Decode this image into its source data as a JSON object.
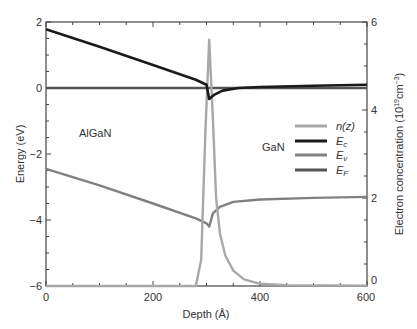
{
  "chart_data": {
    "type": "line",
    "title": "",
    "xlabel": "Depth (Å)",
    "ylabel_left": "Energy (eV)",
    "ylabel_right": "Electron concentration (10^19 cm^-3)",
    "xlim": [
      0,
      600
    ],
    "ylim_left": [
      -6,
      2
    ],
    "ylim_right": [
      0,
      6
    ],
    "x_ticks": [
      0,
      200,
      400,
      600
    ],
    "y_left_ticks": [
      -6,
      -4,
      -2,
      0,
      2
    ],
    "y_right_ticks": [
      0,
      2,
      4,
      6
    ],
    "annotations": [
      {
        "text": "AlGaN",
        "x": 90,
        "y": -1.3
      },
      {
        "text": "GaN",
        "x": 395,
        "y": -1.7
      }
    ],
    "legend": {
      "position": "center-right",
      "entries": [
        "n(z)",
        "Ec",
        "Ev",
        "EF"
      ]
    },
    "series": [
      {
        "name": "n(z)",
        "axis": "right",
        "color": "#a8a8a8",
        "x": [
          0,
          280,
          290,
          298,
          305,
          312,
          318,
          325,
          335,
          350,
          370,
          400,
          450,
          600
        ],
        "y": [
          0,
          0,
          0.6,
          3.5,
          5.6,
          3.8,
          2.0,
          1.2,
          0.7,
          0.35,
          0.15,
          0.05,
          0.02,
          0.01
        ]
      },
      {
        "name": "Ec",
        "axis": "left",
        "color": "#1a1a1a",
        "x": [
          0,
          100,
          200,
          280,
          300,
          305,
          315,
          330,
          360,
          400,
          500,
          600
        ],
        "y": [
          1.78,
          1.25,
          0.7,
          0.25,
          0.1,
          -0.33,
          -0.2,
          -0.08,
          0.0,
          0.03,
          0.07,
          0.1
        ]
      },
      {
        "name": "Ev",
        "axis": "left",
        "color": "#808080",
        "x": [
          0,
          100,
          200,
          280,
          300,
          305,
          312,
          325,
          350,
          400,
          500,
          600
        ],
        "y": [
          -2.45,
          -2.95,
          -3.5,
          -3.95,
          -4.1,
          -4.2,
          -3.8,
          -3.6,
          -3.45,
          -3.38,
          -3.33,
          -3.3
        ]
      },
      {
        "name": "EF",
        "axis": "left",
        "color": "#555555",
        "x": [
          0,
          600
        ],
        "y": [
          0,
          0
        ]
      }
    ]
  },
  "text": {
    "xlabel": "Depth (Å)",
    "ylabel_left": "Energy (eV)",
    "ylabel_right_main": "Electron concentration (10",
    "ylabel_right_sup1": "19",
    "ylabel_right_mid": "cm",
    "ylabel_right_sup2": "−3",
    "ylabel_right_end": ")",
    "algan": "AlGaN",
    "gan": "GaN",
    "legend_n": "n(z)",
    "legend_ec_main": "E",
    "legend_ec_sub": "c",
    "legend_ev_main": "E",
    "legend_ev_sub": "v",
    "legend_ef_main": "E",
    "legend_ef_sub": "F",
    "xt0": "0",
    "xt200": "200",
    "xt400": "400",
    "xt600": "600",
    "yl2": "2",
    "yl0": "0",
    "ylm2": "−2",
    "ylm4": "−4",
    "ylm6": "−6",
    "yr0": "0",
    "yr2": "2",
    "yr4": "4",
    "yr6": "6"
  }
}
